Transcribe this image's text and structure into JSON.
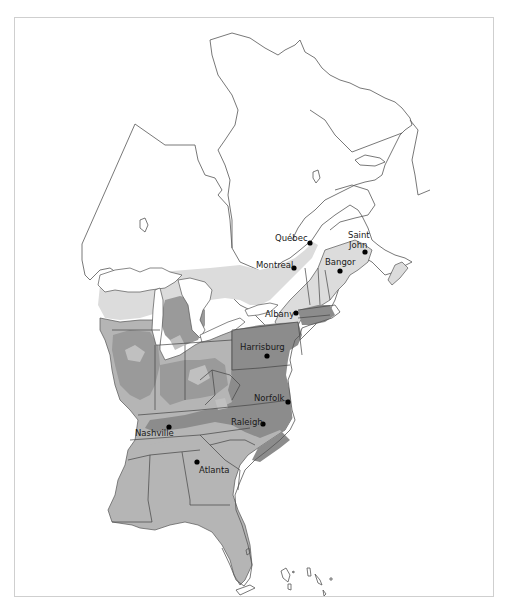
{
  "map": {
    "colors": {
      "background": "#ffffff",
      "zone_light": "#dcdcdc",
      "zone_medium": "#b5b5b5",
      "zone_dark": "#8c8c8c",
      "outline": "#555555",
      "frame": "#cfcfcf",
      "city_dot": "#000000"
    },
    "cities": [
      {
        "name": "Québec",
        "x": 310,
        "y": 243,
        "label_x": 275,
        "label_y": 241
      },
      {
        "name": "Montreal",
        "x": 294,
        "y": 268,
        "label_x": 256,
        "label_y": 268
      },
      {
        "name": "Saint",
        "x": 365,
        "y": 252,
        "label_x": 348,
        "label_y": 238
      },
      {
        "name": "John",
        "x": 365,
        "y": 252,
        "label_x": 349,
        "label_y": 248
      },
      {
        "name": "Bangor",
        "x": 340,
        "y": 271,
        "label_x": 325,
        "label_y": 265
      },
      {
        "name": "Albany",
        "x": 296,
        "y": 313,
        "label_x": 265,
        "label_y": 317
      },
      {
        "name": "Harrisburg",
        "x": 267,
        "y": 356,
        "label_x": 240,
        "label_y": 350
      },
      {
        "name": "Norfolk",
        "x": 288,
        "y": 402,
        "label_x": 254,
        "label_y": 401
      },
      {
        "name": "Raleigh",
        "x": 263,
        "y": 424,
        "label_x": 231,
        "label_y": 425
      },
      {
        "name": "Nashville",
        "x": 169,
        "y": 427,
        "label_x": 135,
        "label_y": 436
      },
      {
        "name": "Atlanta",
        "x": 197,
        "y": 462,
        "label_x": 199,
        "label_y": 473
      }
    ]
  }
}
